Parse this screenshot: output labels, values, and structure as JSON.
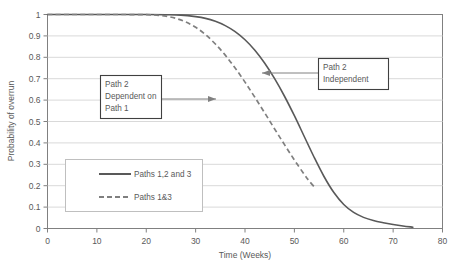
{
  "chart_data": {
    "type": "line",
    "title": "",
    "xlabel": "Time (Weeks)",
    "ylabel": "Probability of overrun",
    "xlim": [
      0,
      80
    ],
    "ylim": [
      0,
      1
    ],
    "grid": "horizontal",
    "legend_position": "lower-left-inside",
    "xticks": [
      0,
      10,
      20,
      30,
      40,
      50,
      60,
      70,
      80
    ],
    "xtick_labels": [
      "0",
      "10",
      "20",
      "30",
      "40",
      "50",
      "60",
      "70",
      "80"
    ],
    "yticks": [
      0,
      0.1,
      0.2,
      0.3,
      0.4,
      0.5,
      0.6,
      0.7,
      0.8,
      0.9,
      1
    ],
    "ytick_labels": [
      "0",
      "0.1",
      "0.2",
      "0.3",
      "0.4",
      "0.5",
      "0.6",
      "0.7",
      "0.8",
      "0.9",
      "1"
    ],
    "series": [
      {
        "name": "Paths 1,2 and 3",
        "style": "solid",
        "color": "#595959",
        "x": [
          0,
          5,
          10,
          15,
          20,
          24,
          27,
          30,
          32,
          34,
          36,
          38,
          40,
          42,
          44,
          46,
          48,
          50,
          52,
          54,
          56,
          58,
          60,
          62,
          64,
          66,
          68,
          70,
          72,
          74
        ],
        "y": [
          1,
          1,
          1,
          1,
          1,
          0.999,
          0.997,
          0.99,
          0.982,
          0.968,
          0.948,
          0.92,
          0.882,
          0.833,
          0.772,
          0.7,
          0.618,
          0.527,
          0.43,
          0.333,
          0.243,
          0.168,
          0.112,
          0.075,
          0.052,
          0.037,
          0.027,
          0.019,
          0.012,
          0.006
        ]
      },
      {
        "name": "Paths 1&3",
        "style": "dashed",
        "color": "#7f7f7f",
        "x": [
          0,
          5,
          10,
          15,
          20,
          22,
          24,
          26,
          28,
          30,
          32,
          34,
          36,
          38,
          40,
          42,
          44,
          46,
          48,
          50,
          52,
          53,
          54
        ],
        "y": [
          1,
          1,
          1,
          1,
          0.999,
          0.997,
          0.992,
          0.982,
          0.965,
          0.94,
          0.906,
          0.862,
          0.81,
          0.75,
          0.684,
          0.613,
          0.54,
          0.465,
          0.392,
          0.32,
          0.253,
          0.222,
          0.195
        ]
      }
    ],
    "annotations": [
      {
        "id": "anno-path2-dependent",
        "lines": [
          "Path 2",
          "Dependent on",
          "Path 1"
        ],
        "arrow_direction": "right",
        "target_series": "Paths 1&3"
      },
      {
        "id": "anno-path2-independent",
        "lines": [
          "Path 2",
          "Independent"
        ],
        "arrow_direction": "left",
        "target_series": "Paths 1,2 and 3"
      }
    ],
    "colors": {
      "solid_series": "#595959",
      "dashed_series": "#7f7f7f",
      "gridline": "#d9d9d9",
      "axis": "#808080",
      "text": "#595959",
      "box_border": "#404040",
      "background": "#ffffff"
    }
  }
}
